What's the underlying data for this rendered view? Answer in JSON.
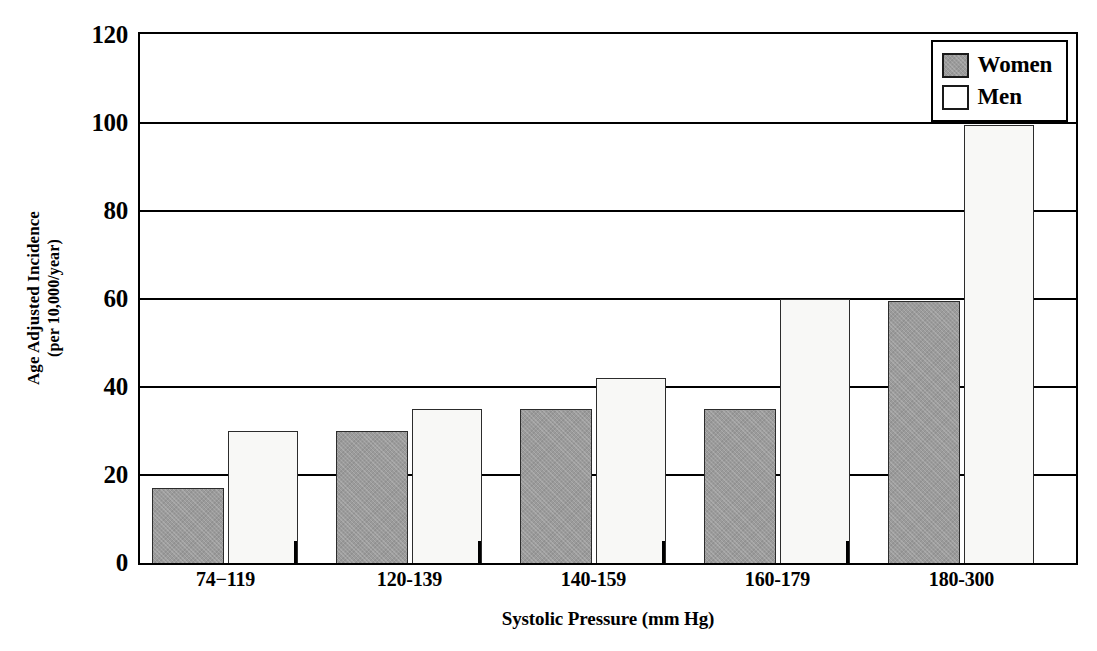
{
  "chart_data": {
    "type": "bar",
    "title": "",
    "subtitle": "",
    "xlabel": "Systolic Pressure (mm Hg)",
    "ylabel_line1": "Age Adjusted Incidence",
    "ylabel_line2": "(per 10,000/year)",
    "ylabel": "Age Adjusted Incidence (per 10,000/year)",
    "categories": [
      "74−119",
      "120-139",
      "140-159",
      "160-179",
      "180-300"
    ],
    "series": [
      {
        "name": "Women",
        "values": [
          17,
          30,
          35,
          35,
          59.5
        ],
        "color": "#9b9b9b"
      },
      {
        "name": "Men",
        "values": [
          30,
          35,
          42,
          60,
          99.5
        ],
        "color": "#f8f8f6"
      }
    ],
    "ylim": [
      0,
      120
    ],
    "ytick_values": [
      0,
      20,
      40,
      60,
      80,
      100,
      120
    ],
    "ytick_labels": [
      "0",
      "20",
      "40",
      "60",
      "80",
      "100",
      "120"
    ],
    "grid": "horizontal",
    "legend_position": "top-right",
    "legend_entries": [
      "Women",
      "Men"
    ]
  },
  "legend": {
    "women_label": "Women",
    "men_label": "Men"
  },
  "axes": {
    "y_title_line1": "Age Adjusted Incidence",
    "y_title_line2": "(per 10,000/year)",
    "x_title": "Systolic Pressure (mm Hg)"
  },
  "colors": {
    "women_fill": "#9b9b9b",
    "men_fill": "#f8f8f6",
    "axis": "#000000"
  }
}
